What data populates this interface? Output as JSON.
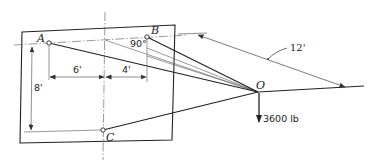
{
  "figure": {
    "points": {
      "A": "A",
      "B": "B",
      "C": "C",
      "O": "O"
    },
    "dimensions": {
      "horizontal_left": "6'",
      "horizontal_right": "4'",
      "vertical": "8'",
      "diagonal": "12'"
    },
    "angle_label": "90°",
    "load_label": "3600 lb",
    "colors": {
      "line": "#222222",
      "thin_line": "#555555",
      "background": "#ffffff"
    }
  }
}
